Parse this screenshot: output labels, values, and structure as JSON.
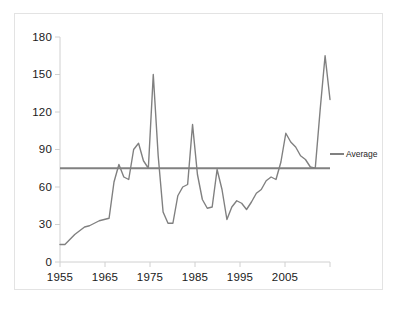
{
  "chart_data": {
    "type": "line",
    "title": "",
    "xlabel": "",
    "ylabel": "",
    "xlim": [
      1955,
      2010
    ],
    "ylim": [
      0,
      180
    ],
    "grid": false,
    "legend_position": "right",
    "y_ticks": [
      "0",
      "30",
      "60",
      "90",
      "120",
      "150",
      "180"
    ],
    "y_tick_values": [
      0,
      30,
      60,
      90,
      120,
      150,
      180
    ],
    "x_ticks": [
      "1955",
      "1965",
      "1975",
      "1985",
      "1995",
      "2005"
    ],
    "x_tick_values": [
      1955,
      1965,
      1975,
      1985,
      1995,
      2005
    ],
    "series": [
      {
        "name": "Series",
        "color": "#808080",
        "show_in_legend": false,
        "x": [
          1955,
          1956,
          1957,
          1958,
          1959,
          1960,
          1961,
          1962,
          1963,
          1964,
          1965,
          1966,
          1967,
          1968,
          1969,
          1970,
          1971,
          1972,
          1973,
          1974,
          1975,
          1976,
          1977,
          1978,
          1979,
          1980,
          1981,
          1982,
          1983,
          1984,
          1985,
          1986,
          1987,
          1988,
          1989,
          1990,
          1991,
          1992,
          1993,
          1994,
          1995,
          1996,
          1997,
          1998,
          1999,
          2000,
          2001,
          2002,
          2003,
          2004,
          2005,
          2006,
          2007,
          2008,
          2009,
          2010
        ],
        "values": [
          14,
          14,
          18,
          22,
          25,
          28,
          29,
          31,
          33,
          34,
          35,
          64,
          78,
          68,
          66,
          90,
          95,
          81,
          75,
          150,
          85,
          40,
          31,
          31,
          53,
          60,
          62,
          110,
          70,
          50,
          43,
          44,
          74,
          58,
          34,
          44,
          49,
          47,
          42,
          48,
          55,
          58,
          65,
          68,
          66,
          80,
          103,
          96,
          92,
          85,
          82,
          76,
          75,
          122,
          165,
          130
        ]
      },
      {
        "name": "Average",
        "color": "#808080",
        "show_in_legend": true,
        "constant_value": 75
      }
    ],
    "legend": [
      {
        "label": "Average",
        "color": "#808080"
      }
    ]
  },
  "legend": {
    "average_label": "Average"
  },
  "axes": {
    "y": {
      "t0": "0",
      "t1": "30",
      "t2": "60",
      "t3": "90",
      "t4": "120",
      "t5": "150",
      "t6": "180"
    },
    "x": {
      "t0": "1955",
      "t1": "1965",
      "t2": "1975",
      "t3": "1985",
      "t4": "1995",
      "t5": "2005"
    }
  }
}
